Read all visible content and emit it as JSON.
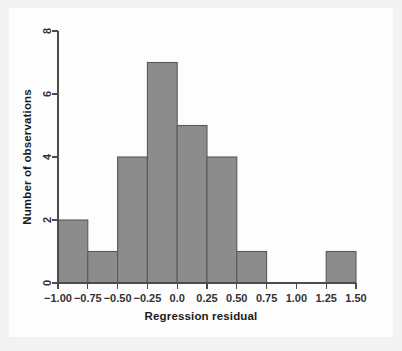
{
  "figure": {
    "background_color": "#f2f2f2",
    "canvas_color": "#fdfdfd",
    "bar_fill_color": "#8c8c8c",
    "bar_edge_color": "#595959",
    "axis_color": "#4c4c4c",
    "text_color": "#1a1a1a"
  },
  "chart_data": {
    "type": "bar",
    "title": "",
    "subtitle": "",
    "xlabel": "Regression residual",
    "ylabel": "Number of observations",
    "grid": false,
    "legend": false,
    "legend_position": "none",
    "bin_width": 0.25,
    "xlim": [
      -1.0,
      1.5
    ],
    "ylim": [
      0,
      8
    ],
    "xticks": [
      -1.0,
      -0.75,
      -0.5,
      -0.25,
      0.0,
      0.25,
      0.5,
      0.75,
      1.0,
      1.25,
      1.5
    ],
    "xtick_labels": [
      "−1.00",
      "−0.75",
      "−0.50",
      "−0.25",
      "0.0",
      "0.25",
      "0.50",
      "0.75",
      "1.00",
      "1.25",
      "1.50"
    ],
    "yticks": [
      0,
      2,
      4,
      6,
      8
    ],
    "ytick_labels": [
      "0",
      "2",
      "4",
      "6",
      "8"
    ],
    "bins": [
      {
        "left": -1.0,
        "right": -0.75,
        "count": 2
      },
      {
        "left": -0.75,
        "right": -0.5,
        "count": 1
      },
      {
        "left": -0.5,
        "right": -0.25,
        "count": 4
      },
      {
        "left": -0.25,
        "right": 0.0,
        "count": 7
      },
      {
        "left": 0.0,
        "right": 0.25,
        "count": 5
      },
      {
        "left": 0.25,
        "right": 0.5,
        "count": 4
      },
      {
        "left": 0.5,
        "right": 0.75,
        "count": 1
      },
      {
        "left": 0.75,
        "right": 1.0,
        "count": 0
      },
      {
        "left": 1.0,
        "right": 1.25,
        "count": 0
      },
      {
        "left": 1.25,
        "right": 1.5,
        "count": 1
      }
    ],
    "categories": [
      "-1.00 to -0.75",
      "-0.75 to -0.50",
      "-0.50 to -0.25",
      "-0.25 to 0.00",
      "0.00 to 0.25",
      "0.25 to 0.50",
      "0.50 to 0.75",
      "0.75 to 1.00",
      "1.00 to 1.25",
      "1.25 to 1.50"
    ],
    "values": [
      2,
      1,
      4,
      7,
      5,
      4,
      1,
      0,
      0,
      1
    ],
    "total_observations": 25
  }
}
